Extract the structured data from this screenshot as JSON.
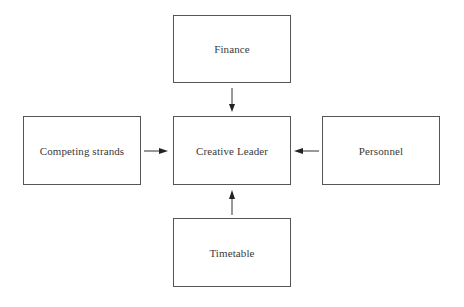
{
  "diagram": {
    "nodes": [
      {
        "id": "finance",
        "label": "Finance"
      },
      {
        "id": "competing",
        "label": "Competing strands"
      },
      {
        "id": "center",
        "label": "Creative Leader"
      },
      {
        "id": "personnel",
        "label": "Personnel"
      },
      {
        "id": "timetable",
        "label": "Timetable"
      }
    ],
    "edges": [
      {
        "from": "finance",
        "to": "center"
      },
      {
        "from": "competing",
        "to": "center"
      },
      {
        "from": "personnel",
        "to": "center"
      },
      {
        "from": "timetable",
        "to": "center"
      }
    ],
    "colors": {
      "line": "#555555",
      "text": "#3a3a3a",
      "background": "#ffffff"
    }
  }
}
